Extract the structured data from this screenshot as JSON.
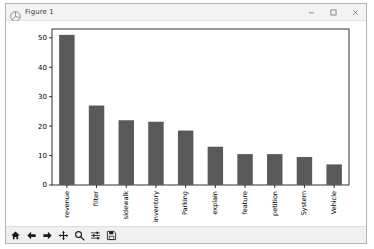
{
  "window": {
    "title": "Figure 1",
    "icon": "matplotlib-icon",
    "controls": [
      {
        "name": "minimize-button",
        "glyph": "minimize"
      },
      {
        "name": "maximize-button",
        "glyph": "maximize"
      },
      {
        "name": "close-button",
        "glyph": "close"
      }
    ]
  },
  "toolbar": {
    "buttons": [
      {
        "name": "home-button",
        "icon": "home-icon",
        "tooltip": "Reset original view"
      },
      {
        "name": "back-button",
        "icon": "arrow-left-icon",
        "tooltip": "Back to previous view"
      },
      {
        "name": "forward-button",
        "icon": "arrow-right-icon",
        "tooltip": "Forward to next view"
      },
      {
        "name": "pan-button",
        "icon": "move-icon",
        "tooltip": "Pan axes with left mouse, zoom with right"
      },
      {
        "name": "zoom-button",
        "icon": "magnifier-icon",
        "tooltip": "Zoom to rectangle"
      },
      {
        "name": "configure-subplots-button",
        "icon": "sliders-icon",
        "tooltip": "Configure subplots"
      },
      {
        "name": "save-button",
        "icon": "floppy-disk-icon",
        "tooltip": "Save the figure"
      }
    ]
  },
  "chart_data": {
    "type": "bar",
    "title": "",
    "xlabel": "",
    "ylabel": "",
    "categories": [
      "revenue",
      "filter",
      "sidewalk",
      "inventory",
      "Parking",
      "explain",
      "feature",
      "petition",
      "System",
      "Vehicle"
    ],
    "values": [
      51,
      27,
      22,
      21.5,
      18.5,
      13,
      10.5,
      10.5,
      9.5,
      7
    ],
    "ylim": [
      0,
      53
    ],
    "yticks": [
      0,
      10,
      20,
      30,
      40,
      50
    ],
    "ytick_labels": [
      "0",
      "10",
      "20",
      "30",
      "40",
      "50"
    ],
    "grid": false,
    "legend": null,
    "bar_color": "#595959",
    "tick_label_rotation": 90
  },
  "colors": {
    "bar": "#595959",
    "axes_line": "#000000",
    "canvas": "#ffffff",
    "window_chrome": "#f0f0f0",
    "tick_text": "#000000"
  }
}
